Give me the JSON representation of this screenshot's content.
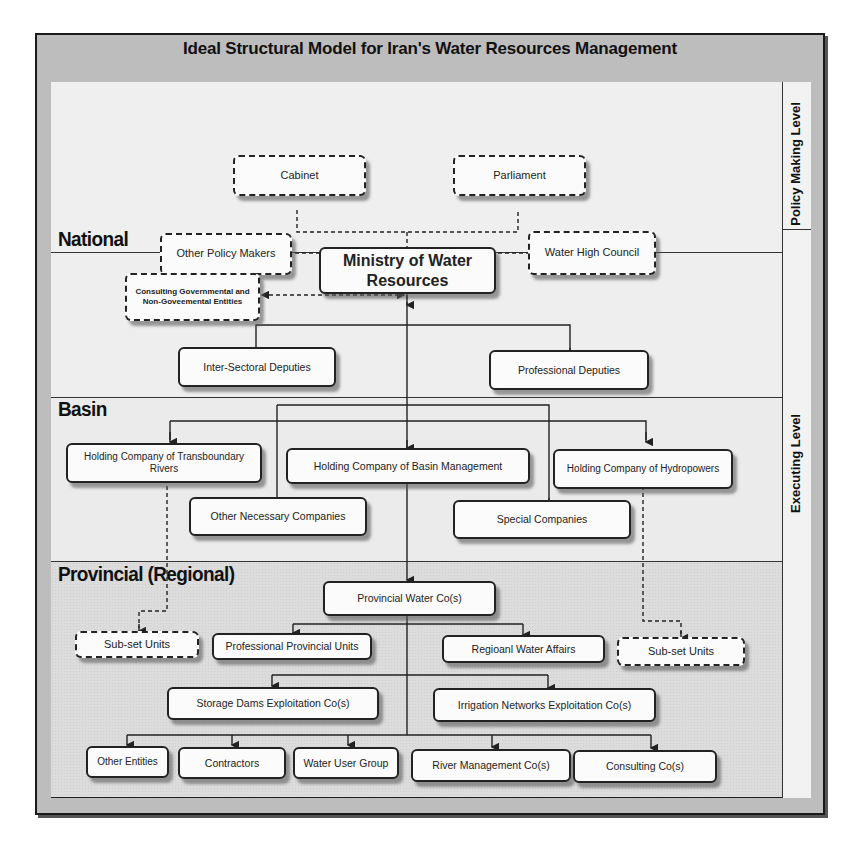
{
  "title": "Ideal Structural Model for Iran's Water Resources Management",
  "levels": {
    "policy": "Policy Making Level",
    "executing": "Executing Level"
  },
  "sections": {
    "national": "National",
    "basin": "Basin",
    "provincial": "Provincial (Regional)"
  },
  "policy_boxes": {
    "cabinet": "Cabinet",
    "parliament": "Parliament",
    "other_policy_makers": "Other Policy Makers",
    "water_high_council": "Water High Council"
  },
  "national_boxes": {
    "ministry": "Ministry of Water Resources",
    "consulting": "Consulting Governmental and Non-Goveemental Entities",
    "inter_sectoral": "Inter-Sectoral Deputies",
    "professional": "Professional Deputies"
  },
  "basin_boxes": {
    "transboundary": "Holding Company of Transboundary Rivers",
    "basin_management": "Holding Company of  Basin Management",
    "hydropowers": "Holding Company of Hydropowers",
    "other_necessary": "Other Necessary Companies",
    "special": "Special Companies"
  },
  "provincial_boxes": {
    "provincial_water": "Provincial Water Co(s)",
    "subset_left": "Sub-set Units",
    "professional_provincial": "Professional Provincial Units",
    "regional_water_affairs": "Regioanl Water Affairs",
    "subset_right": "Sub-set Units",
    "storage_dams": "Storage Dams Exploitation Co(s)",
    "irrigation": "Irrigation Networks  Exploitation Co(s)",
    "other_entities": "Other Entities",
    "contractors": "Contractors",
    "water_user_group": "Water User Group",
    "river_management": "River Management Co(s)",
    "consulting_cos": "Consulting Co(s)"
  }
}
